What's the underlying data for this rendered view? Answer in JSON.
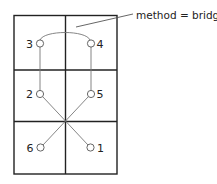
{
  "annotation": {
    "text": "method = bridge"
  },
  "grid": {
    "columns": 2,
    "rows": 3
  },
  "nodes": [
    {
      "id": "1",
      "label": "1",
      "cell": "row3-right"
    },
    {
      "id": "2",
      "label": "2",
      "cell": "row2-left"
    },
    {
      "id": "3",
      "label": "3",
      "cell": "row1-left"
    },
    {
      "id": "4",
      "label": "4",
      "cell": "row1-right"
    },
    {
      "id": "5",
      "label": "5",
      "cell": "row2-right"
    },
    {
      "id": "6",
      "label": "6",
      "cell": "row3-left"
    }
  ],
  "connections": [
    {
      "from": "3",
      "to": "4",
      "type": "bridge-arc"
    },
    {
      "from": "3",
      "to": "2",
      "type": "straight"
    },
    {
      "from": "4",
      "to": "5",
      "type": "straight"
    },
    {
      "from": "2",
      "to": "1",
      "type": "straight"
    },
    {
      "from": "5",
      "to": "6",
      "type": "straight"
    }
  ]
}
